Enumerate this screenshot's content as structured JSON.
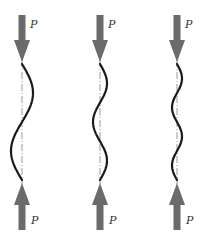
{
  "colors": {
    "arrow": "#6b6b6b",
    "curve": "#1a1a1a",
    "axis": "#9a9a9a",
    "label": "#333333"
  },
  "columns": [
    {
      "name": "mode-1-column",
      "half_waves": 2,
      "first_bulge": "right",
      "top_load_label": "P",
      "bottom_load_label": "P",
      "top_arrow_icon": "arrow-down-icon",
      "bottom_arrow_icon": "arrow-up-icon"
    },
    {
      "name": "mode-2-column",
      "half_waves": 3,
      "first_bulge": "right",
      "top_load_label": "P",
      "bottom_load_label": "P",
      "top_arrow_icon": "arrow-down-icon",
      "bottom_arrow_icon": "arrow-up-icon"
    },
    {
      "name": "mode-3-column",
      "half_waves": 4,
      "first_bulge": "right",
      "top_load_label": "P",
      "bottom_load_label": "P",
      "top_arrow_icon": "arrow-down-icon",
      "bottom_arrow_icon": "arrow-up-icon"
    }
  ]
}
